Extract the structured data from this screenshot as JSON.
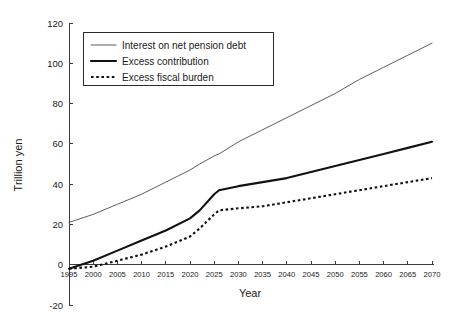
{
  "chart_data": {
    "type": "line",
    "title": "",
    "xlabel": "Year",
    "ylabel": "Trillion yen",
    "xlim": [
      1995,
      2070
    ],
    "ylim": [
      -20,
      120
    ],
    "xticks": [
      1995,
      2000,
      2005,
      2010,
      2015,
      2020,
      2025,
      2030,
      2035,
      2040,
      2045,
      2050,
      2055,
      2060,
      2065,
      2070
    ],
    "yticks": [
      -20,
      0,
      20,
      40,
      60,
      80,
      100,
      120
    ],
    "grid": false,
    "legend_position": "upper-left-inside",
    "x": [
      1995,
      2000,
      2005,
      2010,
      2015,
      2020,
      2022,
      2025,
      2026,
      2030,
      2035,
      2040,
      2045,
      2050,
      2055,
      2060,
      2065,
      2070
    ],
    "series": [
      {
        "name": "Interest on net pension debt",
        "style": "thin-solid",
        "values": [
          21,
          25,
          30,
          35,
          41,
          47,
          50,
          54,
          55,
          61,
          67,
          73,
          79,
          85,
          92,
          98,
          104,
          110
        ]
      },
      {
        "name": "Excess contribution",
        "style": "thick-solid",
        "values": [
          -2,
          2,
          7,
          12,
          17,
          23,
          27,
          35,
          37,
          39,
          41,
          43,
          46,
          49,
          52,
          55,
          58,
          61
        ]
      },
      {
        "name": "Excess fiscal burden",
        "style": "dotted",
        "values": [
          -2,
          -1,
          2,
          5,
          9,
          14,
          18,
          25,
          27,
          28,
          29,
          31,
          33,
          35,
          37,
          39,
          41,
          43
        ]
      }
    ]
  },
  "legend": {
    "entries": [
      {
        "label": "Interest on net pension debt",
        "style": "thin-solid"
      },
      {
        "label": "Excess contribution",
        "style": "thick-solid"
      },
      {
        "label": "Excess fiscal burden",
        "style": "dotted"
      }
    ]
  },
  "axes": {
    "x_title": "Year",
    "y_title": "Trillion yen",
    "x_tick_labels": [
      "1995",
      "2000",
      "2005",
      "2010",
      "2015",
      "2020",
      "2025",
      "2030",
      "2035",
      "2040",
      "2045",
      "2050",
      "2055",
      "2060",
      "2065",
      "2070"
    ],
    "y_tick_labels": [
      "120",
      "100",
      "80",
      "60",
      "40",
      "20",
      "0",
      "-20"
    ]
  },
  "colors": {
    "background": "#ffffff",
    "axis": "#3c3c3c",
    "thin_series": "#4a4a4a",
    "thick_series": "#111111",
    "dotted_series": "#111111",
    "text": "#1a1a1a"
  }
}
